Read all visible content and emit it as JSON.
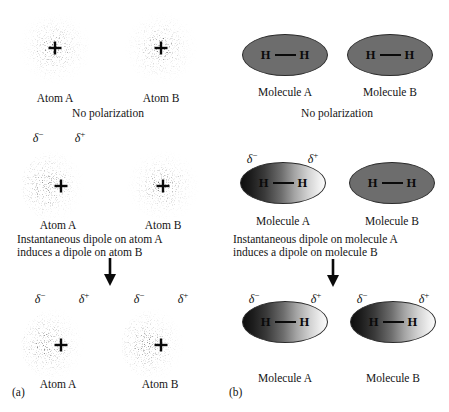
{
  "figure": {
    "panels": [
      {
        "id": "a",
        "label": "(a)",
        "subject": "atoms",
        "rows": [
          {
            "id": "a-row-1",
            "state": "unpolarized",
            "caption": "No polarization",
            "charges": [],
            "objects": [
              {
                "name": "Atom A",
                "polarized": false
              },
              {
                "name": "Atom B",
                "polarized": false
              }
            ]
          },
          {
            "id": "a-row-2",
            "state": "instantaneous-dipole-on-a",
            "caption_line1": "Instantaneous dipole on atom A",
            "caption_line2": "induces a dipole on atom B",
            "objects": [
              {
                "name": "Atom A",
                "polarized": true,
                "charge_left": "δ",
                "charge_left_sign": "−",
                "charge_right": "δ",
                "charge_right_sign": "+"
              },
              {
                "name": "Atom B",
                "polarized": false
              }
            ]
          },
          {
            "id": "a-row-3",
            "state": "both-polarized",
            "objects": [
              {
                "name": "Atom A",
                "polarized": true,
                "charge_left": "δ",
                "charge_left_sign": "−",
                "charge_right": "δ",
                "charge_right_sign": "+"
              },
              {
                "name": "Atom B",
                "polarized": true,
                "charge_left": "δ",
                "charge_left_sign": "−",
                "charge_right": "δ",
                "charge_right_sign": "+"
              }
            ]
          }
        ]
      },
      {
        "id": "b",
        "label": "(b)",
        "subject": "molecules",
        "rows": [
          {
            "id": "b-row-1",
            "state": "unpolarized",
            "caption": "No polarization",
            "objects": [
              {
                "name": "Molecule A",
                "polarized": false,
                "atom_left": "H",
                "atom_right": "H"
              },
              {
                "name": "Molecule B",
                "polarized": false,
                "atom_left": "H",
                "atom_right": "H"
              }
            ]
          },
          {
            "id": "b-row-2",
            "state": "instantaneous-dipole-on-a",
            "caption_line1": "Instantaneous dipole on molecule A",
            "caption_line2": "induces a dipole on molecule B",
            "objects": [
              {
                "name": "Molecule A",
                "polarized": true,
                "atom_left": "H",
                "atom_right": "H",
                "charge_left": "δ",
                "charge_left_sign": "−",
                "charge_right": "δ",
                "charge_right_sign": "+"
              },
              {
                "name": "Molecule B",
                "polarized": false,
                "atom_left": "H",
                "atom_right": "H"
              }
            ]
          },
          {
            "id": "b-row-3",
            "state": "both-polarized",
            "objects": [
              {
                "name": "Molecule A",
                "polarized": true,
                "atom_left": "H",
                "atom_right": "H",
                "charge_left": "δ",
                "charge_left_sign": "−",
                "charge_right": "δ",
                "charge_right_sign": "+"
              },
              {
                "name": "Molecule B",
                "polarized": true,
                "atom_left": "H",
                "atom_right": "H",
                "charge_left": "δ",
                "charge_left_sign": "−",
                "charge_right": "δ",
                "charge_right_sign": "+"
              }
            ]
          }
        ]
      }
    ],
    "colors": {
      "background": "#ffffff",
      "text": "#141414",
      "molecule_flat": "#6d6d6d",
      "molecule_gradient_dark": "#0e0e0e",
      "molecule_gradient_light": "#fafafa",
      "outline": "#2b2b2b",
      "electron_dot": "#1a1a1a"
    },
    "icons": {
      "arrow": "down-arrow-icon",
      "nucleus": "plus-nucleus-icon"
    }
  }
}
